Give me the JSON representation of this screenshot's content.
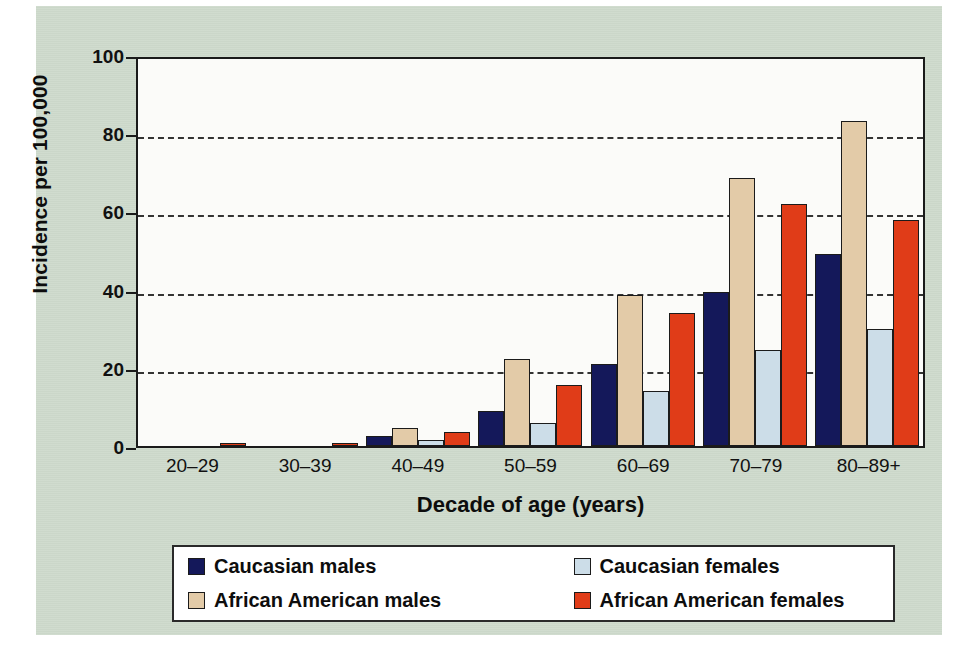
{
  "chart_data": {
    "type": "bar",
    "title": "",
    "xlabel": "Decade of age (years)",
    "ylabel": "Incidence per 100,000",
    "categories": [
      "20–29",
      "30–39",
      "40–49",
      "50–59",
      "60–69",
      "70–79",
      "80–89+"
    ],
    "ylim": [
      0,
      100
    ],
    "yticks": [
      0,
      20,
      40,
      60,
      80,
      100
    ],
    "grid": "horizontal-dashed",
    "legend_position": "bottom",
    "series": [
      {
        "name": "Caucasian males",
        "color": "#14185a",
        "values": [
          0,
          0,
          2.5,
          9,
          21,
          39.5,
          49
        ]
      },
      {
        "name": "African American males",
        "color": "#e3cba8",
        "values": [
          0,
          0,
          4.5,
          22.3,
          38.5,
          68.5,
          83
        ]
      },
      {
        "name": "Caucasian females",
        "color": "#ccdde8",
        "values": [
          0,
          0,
          1.5,
          6,
          14,
          24.5,
          30
        ]
      },
      {
        "name": "African American females",
        "color": "#e03c18",
        "values": [
          0.7,
          0.7,
          3.5,
          15.6,
          34,
          62,
          57.8
        ]
      }
    ]
  },
  "axis": {
    "y_tick_labels": [
      "100",
      "80",
      "60",
      "40",
      "20",
      "0"
    ],
    "y_title": "Incidence per 100,000",
    "x_title": "Decade of age (years)"
  },
  "legend": {
    "items": [
      {
        "label": "Caucasian males",
        "color": "#14185a"
      },
      {
        "label": "Caucasian females",
        "color": "#ccdde8"
      },
      {
        "label": "African American males",
        "color": "#e3cba8"
      },
      {
        "label": "African American females",
        "color": "#e03c18"
      }
    ]
  },
  "colors": {
    "panel_background": "#cfdbcd",
    "plot_background": "#fbfbf9",
    "axis": "#1a1a1a",
    "caucasian_males": "#14185a",
    "caucasian_females": "#ccdde8",
    "african_american_males": "#e3cba8",
    "african_american_females": "#e03c18"
  }
}
